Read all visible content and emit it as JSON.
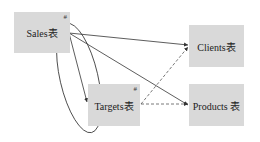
{
  "diagram": {
    "nodes": [
      {
        "id": "sales",
        "label": "Sales表",
        "marker": "#",
        "x": 14,
        "y": 12,
        "w": 56,
        "h": 41
      },
      {
        "id": "clients",
        "label": "Clients表",
        "marker": "",
        "x": 189,
        "y": 25,
        "w": 55,
        "h": 42
      },
      {
        "id": "targets",
        "label": "Targets表",
        "marker": "#",
        "x": 88,
        "y": 84,
        "w": 52,
        "h": 42
      },
      {
        "id": "products",
        "label": "Products 表",
        "marker": "",
        "x": 189,
        "y": 84,
        "w": 55,
        "h": 42
      }
    ],
    "edges": [
      {
        "from": "sales",
        "to": "clients",
        "style": "solid",
        "arrow": true
      },
      {
        "from": "sales",
        "to": "products",
        "style": "solid",
        "arrow": true
      },
      {
        "from": "sales",
        "to": "targets",
        "style": "solid",
        "arrow": true
      },
      {
        "from": "targets",
        "to": "clients",
        "style": "dashed",
        "arrow": true
      },
      {
        "from": "targets",
        "to": "products",
        "style": "dashed",
        "arrow": true
      }
    ],
    "annotations": [
      {
        "type": "ellipse",
        "encloses": "sales-to-targets relationship"
      }
    ]
  }
}
